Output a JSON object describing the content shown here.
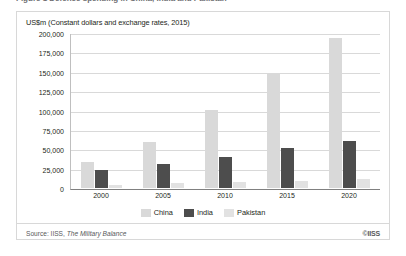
{
  "figure": {
    "units_caption": "US$m (Constant dollars and exchange rates, 2015)",
    "clipped_title": "Figure 1  Defence spending in China, India and Pakistan",
    "source": {
      "prefix": "Source: IISS, ",
      "publication": "The Military Balance"
    },
    "copyright": "©IISS"
  },
  "colors": {
    "china": "#d9d9d9",
    "india": "#4d4d4d",
    "pakistan": "#e2e2e2",
    "gridline": "#d9d9d9",
    "axis": "#808080",
    "border": "#d8d8d8",
    "text": "#231f20",
    "muted_text": "#58595b"
  },
  "chart_data": {
    "type": "bar",
    "title": "",
    "subtitle": "US$m (Constant dollars and exchange rates, 2015)",
    "xlabel": "",
    "ylabel": "US$m (Constant dollars and exchange rates, 2015)",
    "categories": [
      "2000",
      "2005",
      "2010",
      "2015",
      "2020"
    ],
    "series": [
      {
        "name": "China",
        "values": [
          34000,
          59000,
          101000,
          147000,
          193000
        ]
      },
      {
        "name": "India",
        "values": [
          23000,
          31000,
          40000,
          51000,
          61000
        ]
      },
      {
        "name": "Pakistan",
        "values": [
          3500,
          6000,
          7500,
          9000,
          11000
        ]
      }
    ],
    "ylim": [
      0,
      200000
    ],
    "ytick_values": [
      0,
      25000,
      50000,
      75000,
      100000,
      125000,
      150000,
      175000,
      200000
    ],
    "ytick_labels": [
      "0",
      "25,000",
      "50,000",
      "75,000",
      "100,000",
      "125,000",
      "150,000",
      "175,000",
      "200,000"
    ],
    "grid": true,
    "legend_position": "bottom",
    "legend": [
      "China",
      "India",
      "Pakistan"
    ]
  }
}
